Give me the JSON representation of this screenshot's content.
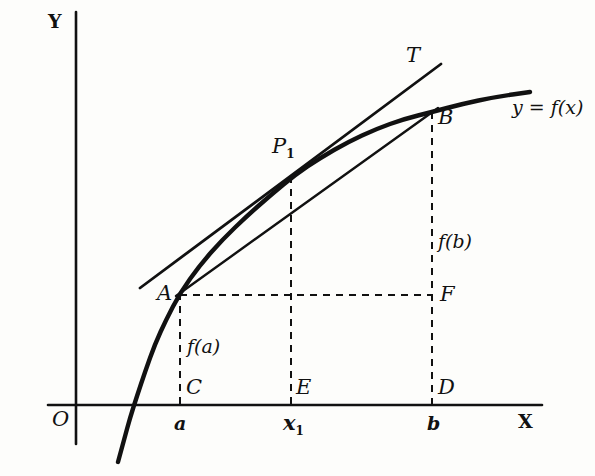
{
  "figure": {
    "kind": "calculus-diagram",
    "ink_color": "#111111",
    "background_color": "#fdfdfb"
  },
  "axes": {
    "y_label": "Y",
    "x_label": "X",
    "origin_label": "O"
  },
  "ticks": [
    {
      "name": "a",
      "label": "a"
    },
    {
      "name": "x1",
      "label": "x",
      "sub": "1"
    },
    {
      "name": "b",
      "label": "b"
    }
  ],
  "points": [
    {
      "name": "A",
      "label": "A"
    },
    {
      "name": "B",
      "label": "B"
    },
    {
      "name": "C",
      "label": "C"
    },
    {
      "name": "D",
      "label": "D"
    },
    {
      "name": "E",
      "label": "E"
    },
    {
      "name": "F",
      "label": "F"
    },
    {
      "name": "P1",
      "label": "P",
      "sub": "1"
    },
    {
      "name": "T",
      "label": "T"
    }
  ],
  "annotations": {
    "curve_equation": "y = f(x)",
    "ordinate_a": "f(a)",
    "ordinate_b": "f(b)",
    "tangent_label": "T"
  },
  "chart_data": {
    "type": "line",
    "title": "",
    "xlabel": "X",
    "ylabel": "Y",
    "curve_name": "y = f(x)",
    "curve_points_px": [
      [
        118,
        462
      ],
      [
        124,
        440
      ],
      [
        130,
        418
      ],
      [
        137,
        396
      ],
      [
        145,
        372
      ],
      [
        155,
        344
      ],
      [
        166,
        320
      ],
      [
        180,
        293
      ],
      [
        200,
        265
      ],
      [
        222,
        240
      ],
      [
        248,
        215
      ],
      [
        272,
        194
      ],
      [
        295,
        175
      ],
      [
        320,
        158
      ],
      [
        348,
        142
      ],
      [
        376,
        129
      ],
      [
        404,
        119
      ],
      [
        432,
        112
      ],
      [
        462,
        104
      ],
      [
        495,
        97
      ],
      [
        530,
        92
      ]
    ],
    "secant_px": [
      [
        176,
        296
      ],
      [
        438,
        108
      ]
    ],
    "tangent_px": [
      [
        140,
        288
      ],
      [
        441,
        64
      ]
    ],
    "tangent_touch_px": [
      291,
      176
    ],
    "axis_x_px": [
      [
        48,
        405
      ],
      [
        542,
        405
      ]
    ],
    "axis_y_px": [
      [
        76,
        12
      ],
      [
        76,
        444
      ]
    ],
    "dashed_segments_px": [
      [
        [
          180,
          293
        ],
        [
          180,
          405
        ]
      ],
      [
        [
          291,
          176
        ],
        [
          291,
          405
        ]
      ],
      [
        [
          432,
          112
        ],
        [
          432,
          405
        ]
      ],
      [
        [
          180,
          295
        ],
        [
          432,
          295
        ]
      ]
    ]
  }
}
